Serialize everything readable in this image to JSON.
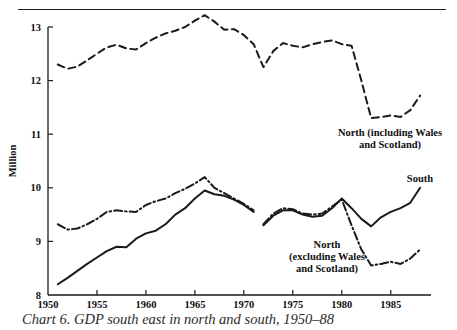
{
  "figure": {
    "top_rule_title": "",
    "caption": "Chart 6.  GDP south east in north and south, 1950–88"
  },
  "chart_data": {
    "type": "line",
    "title": "",
    "xlabel": "",
    "ylabel": "Million",
    "xlim": [
      1950,
      1988.5
    ],
    "ylim": [
      8,
      13
    ],
    "grid": false,
    "legend_position": "inline-annotations",
    "x_ticks": [
      "1950",
      "1955",
      "1960",
      "1965",
      "1970",
      "1975",
      "1980",
      "1985"
    ],
    "x_tick_values": [
      1950,
      1955,
      1960,
      1965,
      1970,
      1975,
      1980,
      1985
    ],
    "y_ticks": [
      "8",
      "9",
      "10",
      "11",
      "12",
      "13"
    ],
    "y_tick_values": [
      8,
      9,
      10,
      11,
      12,
      13
    ],
    "series": [
      {
        "name": "North (including Wales and Scotland)",
        "style": "dashed",
        "label_lines": [
          "North (including Wales",
          "and Scotland)"
        ],
        "x": [
          1951,
          1952,
          1953,
          1954,
          1955,
          1956,
          1957,
          1958,
          1959,
          1960,
          1961,
          1962,
          1963,
          1964,
          1965,
          1966,
          1967,
          1968,
          1969,
          1970,
          1971,
          1972,
          1973,
          1974,
          1975,
          1976,
          1977,
          1978,
          1979,
          1980,
          1981,
          1982,
          1983,
          1984,
          1985,
          1986,
          1987,
          1988
        ],
        "values": [
          12.3,
          12.22,
          12.26,
          12.38,
          12.5,
          12.62,
          12.67,
          12.6,
          12.58,
          12.7,
          12.8,
          12.88,
          12.93,
          13.0,
          13.12,
          13.22,
          13.1,
          12.95,
          12.96,
          12.85,
          12.68,
          12.25,
          12.55,
          12.7,
          12.65,
          12.62,
          12.68,
          12.72,
          12.75,
          12.68,
          12.65,
          12.0,
          11.3,
          11.32,
          11.35,
          11.32,
          11.45,
          11.72
        ]
      },
      {
        "name": "South",
        "style": "solid",
        "label_lines": [
          "South"
        ],
        "segments": [
          {
            "x": [
              1951,
              1952,
              1953,
              1954,
              1955,
              1956,
              1957,
              1958,
              1959,
              1960,
              1961,
              1962,
              1963,
              1964,
              1965,
              1966,
              1967,
              1968,
              1969,
              1970,
              1971
            ],
            "values": [
              8.2,
              8.32,
              8.45,
              8.58,
              8.7,
              8.82,
              8.9,
              8.89,
              9.05,
              9.15,
              9.2,
              9.32,
              9.5,
              9.62,
              9.8,
              9.95,
              9.88,
              9.85,
              9.78,
              9.68,
              9.55
            ]
          },
          {
            "x": [
              1972,
              1973,
              1974,
              1975,
              1976,
              1977,
              1978,
              1979,
              1980,
              1981,
              1982,
              1983,
              1984,
              1985,
              1986,
              1987,
              1988
            ],
            "values": [
              9.3,
              9.48,
              9.58,
              9.58,
              9.5,
              9.46,
              9.48,
              9.62,
              9.8,
              9.62,
              9.42,
              9.28,
              9.45,
              9.55,
              9.62,
              9.72,
              10.0
            ]
          }
        ]
      },
      {
        "name": "North (excluding Wales and Scotland)",
        "style": "dash-dot",
        "label_lines": [
          "North",
          "(excluding Wales",
          "and Scotland)"
        ],
        "segments": [
          {
            "x": [
              1951,
              1952,
              1953,
              1954,
              1955,
              1956,
              1957,
              1958,
              1959,
              1960,
              1961,
              1962,
              1963,
              1964,
              1965,
              1966,
              1967,
              1968,
              1969,
              1970,
              1971
            ],
            "values": [
              9.32,
              9.22,
              9.24,
              9.32,
              9.42,
              9.55,
              9.58,
              9.56,
              9.55,
              9.68,
              9.75,
              9.8,
              9.9,
              9.98,
              10.08,
              10.2,
              10.0,
              9.9,
              9.8,
              9.7,
              9.58
            ]
          },
          {
            "x": [
              1972,
              1973,
              1974,
              1975,
              1976,
              1977,
              1978,
              1979,
              1980,
              1981,
              1982,
              1983,
              1984,
              1985,
              1986,
              1987,
              1988
            ],
            "values": [
              9.32,
              9.52,
              9.62,
              9.6,
              9.52,
              9.5,
              9.52,
              9.65,
              9.78,
              9.3,
              8.85,
              8.55,
              8.58,
              8.62,
              8.58,
              8.68,
              8.85
            ]
          }
        ]
      }
    ]
  }
}
